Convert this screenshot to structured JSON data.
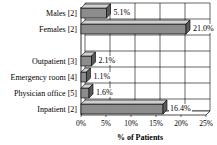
{
  "chart_data": {
    "type": "bar",
    "orientation": "horizontal",
    "title": "",
    "xlabel": "% of Patients",
    "ylabel": "",
    "categories": [
      "Males [2]",
      "Females [2]",
      "",
      "Outpatient [3]",
      "Emergency room [4]",
      "Physician office [5]",
      "Inpatient [2]"
    ],
    "values": [
      5.1,
      21.0,
      null,
      2.1,
      1.1,
      1.6,
      16.4
    ],
    "data_labels": [
      "5.1%",
      "21.0%",
      "",
      "2.1%",
      "1.1%",
      "1.6%",
      "16.4%"
    ],
    "xlim": [
      0,
      25
    ],
    "xticks": [
      "0%",
      "5%",
      "10%",
      "15%",
      "20%",
      "25%"
    ],
    "grid": true,
    "legend": null,
    "style": "3d-bars",
    "colors": {
      "bar_face": "#8c8c8c",
      "bar_top": "#d0d0d0",
      "bar_side": "#5a5a5a",
      "grid": "#000000"
    }
  }
}
